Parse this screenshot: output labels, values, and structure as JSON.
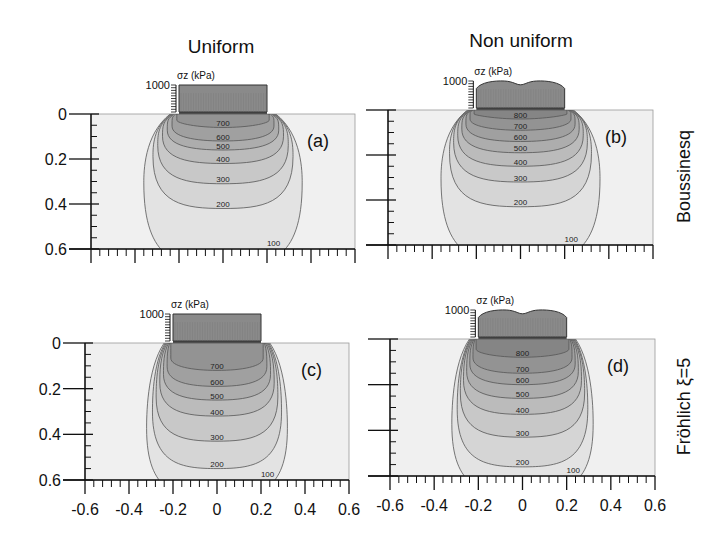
{
  "figure": {
    "column_titles": [
      "Uniform",
      "Non uniform"
    ],
    "row_labels": [
      "Boussinesq",
      "Fröhlich ξ=5"
    ],
    "load_axis_label": "σz (kPa)",
    "load_axis_max": "1000",
    "colors": {
      "background": "#ffffff",
      "plot_fill": "#f0f0f0",
      "load_fill": "#8a8a8a",
      "contour_line": "#555555",
      "axis": "#111111"
    }
  },
  "chart_data": {
    "type": "heatmap",
    "xlabel": "",
    "ylabel": "",
    "x_ticks": [
      "-0.6",
      "-0.4",
      "-0.2",
      "0",
      "0.2",
      "0.4",
      "0.6"
    ],
    "y_ticks": [
      "0",
      "0.2",
      "0.4",
      "0.6"
    ],
    "xlim": [
      -0.6,
      0.6
    ],
    "ylim": [
      0,
      0.6
    ],
    "y_inverted": true,
    "contour_units": "kPa",
    "panels": [
      {
        "id": "a",
        "label": "(a)",
        "load": "Uniform",
        "theory": "Boussinesq",
        "load_half_width": 0.2,
        "load_max_kpa": 1000,
        "load_shape": "flat",
        "contours": [
          {
            "level": 700,
            "depth_at_center": 0.06
          },
          {
            "level": 600,
            "depth_at_center": 0.12
          },
          {
            "level": 500,
            "depth_at_center": 0.16
          },
          {
            "level": 400,
            "depth_at_center": 0.22
          },
          {
            "level": 300,
            "depth_at_center": 0.31
          },
          {
            "level": 200,
            "depth_at_center": 0.42
          },
          {
            "level": 100,
            "depth_at_center": 0.6
          }
        ]
      },
      {
        "id": "b",
        "label": "(b)",
        "load": "Non uniform",
        "theory": "Boussinesq",
        "load_half_width": 0.2,
        "load_max_kpa": 1000,
        "load_shape": "bimodal",
        "contours": [
          {
            "level": 800,
            "depth_at_center": 0.04
          },
          {
            "level": 700,
            "depth_at_center": 0.09
          },
          {
            "level": 600,
            "depth_at_center": 0.14
          },
          {
            "level": 500,
            "depth_at_center": 0.19
          },
          {
            "level": 400,
            "depth_at_center": 0.25
          },
          {
            "level": 300,
            "depth_at_center": 0.32
          },
          {
            "level": 200,
            "depth_at_center": 0.43
          },
          {
            "level": 100,
            "depth_at_center": 0.6
          }
        ]
      },
      {
        "id": "c",
        "label": "(c)",
        "load": "Uniform",
        "theory": "Fröhlich ξ=5",
        "load_half_width": 0.2,
        "load_max_kpa": 1000,
        "load_shape": "flat",
        "contours": [
          {
            "level": 700,
            "depth_at_center": 0.12
          },
          {
            "level": 600,
            "depth_at_center": 0.19
          },
          {
            "level": 500,
            "depth_at_center": 0.25
          },
          {
            "level": 400,
            "depth_at_center": 0.32
          },
          {
            "level": 300,
            "depth_at_center": 0.43
          },
          {
            "level": 200,
            "depth_at_center": 0.55
          },
          {
            "level": 100,
            "depth_at_center": 0.6
          }
        ]
      },
      {
        "id": "d",
        "label": "(d)",
        "load": "Non uniform",
        "theory": "Fröhlich ξ=5",
        "load_half_width": 0.2,
        "load_max_kpa": 1000,
        "load_shape": "bimodal",
        "contours": [
          {
            "level": 800,
            "depth_at_center": 0.08
          },
          {
            "level": 700,
            "depth_at_center": 0.15
          },
          {
            "level": 600,
            "depth_at_center": 0.2
          },
          {
            "level": 500,
            "depth_at_center": 0.26
          },
          {
            "level": 400,
            "depth_at_center": 0.33
          },
          {
            "level": 300,
            "depth_at_center": 0.43
          },
          {
            "level": 200,
            "depth_at_center": 0.56
          },
          {
            "level": 100,
            "depth_at_center": 0.6
          }
        ]
      }
    ]
  },
  "layout": {
    "panels": [
      {
        "left": 91,
        "right": 355,
        "top": 114,
        "bottom": 249,
        "show_xlabels": false,
        "show_ylabels": true
      },
      {
        "left": 388,
        "right": 653,
        "top": 110,
        "bottom": 245,
        "show_xlabels": false,
        "show_ylabels": false
      },
      {
        "left": 85,
        "right": 349,
        "top": 343,
        "bottom": 480,
        "show_xlabels": true,
        "show_ylabels": true
      },
      {
        "left": 390,
        "right": 655,
        "top": 339,
        "bottom": 476,
        "show_xlabels": true,
        "show_ylabels": false
      }
    ],
    "contour_spread": [
      {
        "100": [
          0.32,
          0.0
        ]
      },
      {
        "100": [
          0.33,
          0.0
        ]
      },
      {
        "100": [
          0.34,
          0.0
        ]
      },
      {
        "100": [
          0.35,
          0.0
        ]
      }
    ]
  }
}
